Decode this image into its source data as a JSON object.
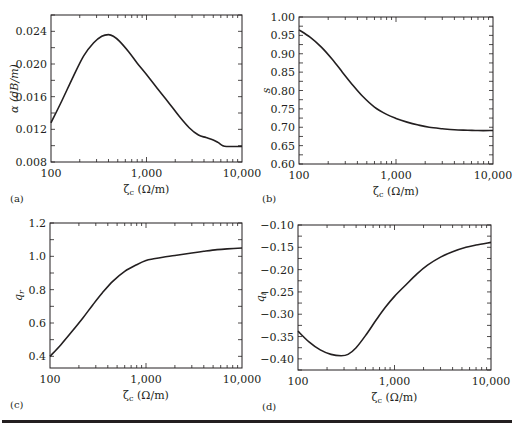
{
  "figure": {
    "rule_color": "#231f20",
    "line_color": "#231f20"
  },
  "chart_data": [
    {
      "panel": "(a)",
      "type": "line",
      "title": "",
      "xlabel": "ζc (Ω/m)",
      "ylabel": "α (dB/m)",
      "xscale": "log",
      "xlim": [
        100,
        10000
      ],
      "ylim": [
        0.008,
        0.026
      ],
      "xticks": [
        100,
        1000,
        10000
      ],
      "xtick_labels": [
        "100",
        "1,000",
        "10,000"
      ],
      "yticks": [
        0.008,
        0.012,
        0.016,
        0.02,
        0.024
      ],
      "ytick_labels": [
        "0.008",
        "0.012",
        "0.016",
        "0.020",
        "0.024"
      ],
      "grid": false,
      "legend": null,
      "series": [
        {
          "name": "α",
          "x": [
            100,
            130,
            170,
            220,
            280,
            340,
            400,
            450,
            520,
            650,
            800,
            1000,
            1300,
            1700,
            2200,
            2800,
            3500,
            4200,
            5000,
            5600,
            6300,
            7000,
            8000,
            10000
          ],
          "y": [
            0.0128,
            0.0155,
            0.0184,
            0.021,
            0.0226,
            0.0234,
            0.0236,
            0.0234,
            0.0228,
            0.0215,
            0.0201,
            0.0187,
            0.017,
            0.0153,
            0.0136,
            0.0122,
            0.0113,
            0.011,
            0.0107,
            0.0104,
            0.01,
            0.0099,
            0.0099,
            0.0099
          ]
        }
      ]
    },
    {
      "panel": "(b)",
      "type": "line",
      "title": "",
      "xlabel": "ζc (Ω/m)",
      "ylabel": "s",
      "xscale": "log",
      "xlim": [
        100,
        10000
      ],
      "ylim": [
        0.6,
        1.0
      ],
      "xticks": [
        100,
        1000,
        10000
      ],
      "xtick_labels": [
        "100",
        "1,000",
        "10,000"
      ],
      "yticks": [
        0.6,
        0.65,
        0.7,
        0.75,
        0.8,
        0.85,
        0.9,
        0.95,
        1.0
      ],
      "ytick_labels": [
        "0.60",
        "0.65",
        "0.70",
        "0.75",
        "0.80",
        "0.85",
        "0.90",
        "0.95",
        "1.00"
      ],
      "grid": false,
      "legend": null,
      "series": [
        {
          "name": "s",
          "x": [
            100,
            130,
            170,
            220,
            280,
            350,
            450,
            600,
            800,
            1000,
            1300,
            1700,
            2200,
            3000,
            4000,
            5500,
            7000,
            10000
          ],
          "y": [
            0.965,
            0.945,
            0.918,
            0.885,
            0.85,
            0.818,
            0.785,
            0.755,
            0.735,
            0.724,
            0.714,
            0.706,
            0.7,
            0.696,
            0.693,
            0.692,
            0.691,
            0.691
          ]
        }
      ]
    },
    {
      "panel": "(c)",
      "type": "line",
      "title": "",
      "xlabel": "ζc (Ω/m)",
      "ylabel": "qr",
      "xscale": "log",
      "xlim": [
        100,
        10000
      ],
      "ylim": [
        0.33,
        1.2
      ],
      "xticks": [
        100,
        1000,
        10000
      ],
      "xtick_labels": [
        "100",
        "1,000",
        "10,000"
      ],
      "yticks": [
        0.4,
        0.6,
        0.8,
        1.0,
        1.2
      ],
      "ytick_labels": [
        "0.4",
        "0.6",
        "0.8",
        "1.0",
        "1.2"
      ],
      "grid": false,
      "legend": null,
      "series": [
        {
          "name": "qr",
          "x": [
            100,
            130,
            170,
            220,
            280,
            350,
            450,
            600,
            800,
            1000,
            1200,
            1500,
            2000,
            3000,
            4000,
            5500,
            7000,
            10000
          ],
          "y": [
            0.4,
            0.47,
            0.55,
            0.63,
            0.71,
            0.78,
            0.85,
            0.91,
            0.95,
            0.975,
            0.985,
            0.995,
            1.005,
            1.02,
            1.03,
            1.04,
            1.045,
            1.05
          ]
        }
      ]
    },
    {
      "panel": "(d)",
      "type": "line",
      "title": "",
      "xlabel": "ζc (Ω/m)",
      "ylabel": "qi",
      "xscale": "log",
      "xlim": [
        100,
        10000
      ],
      "ylim": [
        -0.425,
        -0.1
      ],
      "xticks": [
        100,
        1000,
        10000
      ],
      "xtick_labels": [
        "100",
        "1,000",
        "10,000"
      ],
      "yticks": [
        -0.4,
        -0.35,
        -0.3,
        -0.25,
        -0.2,
        -0.15,
        -0.1
      ],
      "ytick_labels": [
        "−0.40",
        "−0.35",
        "−0.30",
        "−0.25",
        "−0.20",
        "−0.15",
        "−0.10"
      ],
      "grid": false,
      "legend": null,
      "series": [
        {
          "name": "qi",
          "x": [
            100,
            130,
            170,
            220,
            280,
            330,
            400,
            500,
            650,
            800,
            1000,
            1300,
            1700,
            2200,
            3000,
            4000,
            5500,
            7000,
            10000
          ],
          "y": [
            -0.338,
            -0.362,
            -0.38,
            -0.39,
            -0.393,
            -0.39,
            -0.375,
            -0.348,
            -0.312,
            -0.285,
            -0.26,
            -0.235,
            -0.21,
            -0.19,
            -0.172,
            -0.16,
            -0.15,
            -0.145,
            -0.139
          ]
        }
      ]
    }
  ],
  "panels": [
    {
      "label": "(a)",
      "xlabel_main": "ζ",
      "xlabel_sub": "c",
      "xlabel_unit": " (Ω/m)",
      "ylabel_main": "α (dB/m)",
      "ylabel_sub": ""
    },
    {
      "label": "(b)",
      "xlabel_main": "ζ",
      "xlabel_sub": "c",
      "xlabel_unit": " (Ω/m)",
      "ylabel_main": "s",
      "ylabel_sub": ""
    },
    {
      "label": "(c)",
      "xlabel_main": "ζ",
      "xlabel_sub": "c",
      "xlabel_unit": " (Ω/m)",
      "ylabel_main": "q",
      "ylabel_sub": "r"
    },
    {
      "label": "(d)",
      "xlabel_main": "ζ",
      "xlabel_sub": "c",
      "xlabel_unit": " (Ω/m)",
      "ylabel_main": "q",
      "ylabel_sub": "i"
    }
  ]
}
